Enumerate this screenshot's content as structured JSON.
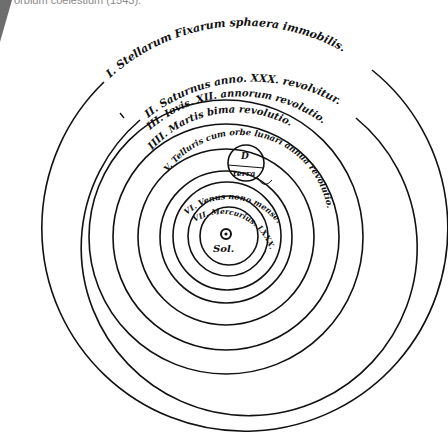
{
  "caption": "orbium coelestium (1543).",
  "diagram": {
    "center_label": "Sol.",
    "sun_icon": "sun-symbol",
    "spheres": [
      {
        "numeral": "I.",
        "label": "I. Stellarum Fixarum sphaera immobilis."
      },
      {
        "numeral": "II.",
        "label": "II. Saturnus anno. XXX. revolvitur."
      },
      {
        "numeral": "III.",
        "label": "III. Iovis. XII. annorum revolutio."
      },
      {
        "numeral": "IIII.",
        "label": "IIII. Martis bima revolutio."
      },
      {
        "numeral": "V.",
        "label": "V. Telluris cum orbe lunari annua revolutio."
      },
      {
        "numeral": "VI.",
        "label": "VI. Venus nono mense."
      },
      {
        "numeral": "VII.",
        "label": "VII. Mercurius. LXXX. dierum."
      }
    ],
    "epicycle": {
      "moon_symbol": "D",
      "earth_label": "terra"
    }
  }
}
